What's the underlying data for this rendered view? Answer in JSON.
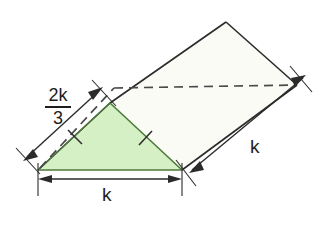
{
  "figure": {
    "background_color": "#ffffff",
    "stroke_color": "#2b2b2b",
    "shaded_fill": "#d6f0c6",
    "shaded_stroke": "#4c7a3a",
    "plain_fill": "#fbfbf6",
    "dashed_color": "#4a4a4a"
  },
  "labels": {
    "k_bottom": "k",
    "k_right": "k",
    "fraction_numerator": "2k",
    "fraction_denominator": "3"
  },
  "dimensions": [
    {
      "name": "bottom-edge",
      "label": "k",
      "orientation": "horizontal",
      "from": [
        38,
        178
      ],
      "to": [
        182,
        178
      ]
    },
    {
      "name": "right-edge",
      "label": "k",
      "orientation": "diagonal",
      "from": [
        190,
        172
      ],
      "to": [
        305,
        76
      ]
    },
    {
      "name": "upper-left-edge",
      "label": "2k/3",
      "orientation": "diagonal",
      "from": [
        24,
        158
      ],
      "to": [
        100,
        90
      ]
    }
  ],
  "shapes": {
    "shaded_triangle": {
      "name": "shaded-triangle",
      "points": "38,170 110,103 182,170",
      "tick_marks": 2
    },
    "folded_quad": {
      "name": "folded-quadrilateral",
      "points": "110,103 226,22 297,85 182,170"
    },
    "crease_dashed": {
      "name": "crease-dashed-line",
      "segments": [
        "38,170 113,88",
        "113,88 297,85"
      ]
    }
  }
}
